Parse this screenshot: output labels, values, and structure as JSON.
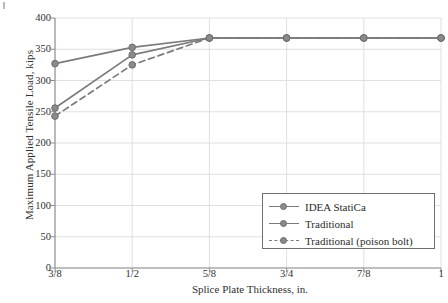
{
  "chart_data": {
    "type": "line",
    "title": "",
    "xlabel": "Splice Plate Thickness, in.",
    "ylabel": "Maximum Applied Tensile Load, kips",
    "categories": [
      "3/8",
      "1/2",
      "5/8",
      "3/4",
      "7/8",
      "1"
    ],
    "x_values": [
      0.375,
      0.5,
      0.625,
      0.75,
      0.875,
      1.0
    ],
    "xlim": [
      0.375,
      1.0
    ],
    "ylim": [
      0,
      400
    ],
    "yticks": [
      0,
      50,
      100,
      150,
      200,
      250,
      300,
      350,
      400
    ],
    "ytick_labels": [
      "0",
      "50",
      "100",
      "150",
      "200",
      "250",
      "300",
      "350",
      "400"
    ],
    "grid": true,
    "legend_position": "lower right",
    "series": [
      {
        "name": "IDEA StatiCa",
        "values": [
          327,
          353,
          368,
          368,
          368,
          368
        ],
        "style": "solid",
        "color": "#7b7b7b",
        "marker": "circle"
      },
      {
        "name": "Traditional",
        "values": [
          256,
          341,
          368,
          368,
          368,
          368
        ],
        "style": "solid",
        "color": "#7b7b7b",
        "marker": "circle"
      },
      {
        "name": "Traditional (poison bolt)",
        "values": [
          243,
          325,
          368,
          368,
          368,
          368
        ],
        "style": "dashed",
        "color": "#7b7b7b",
        "marker": "circle"
      }
    ]
  },
  "legend": {
    "items": [
      {
        "label": "IDEA StatiCa"
      },
      {
        "label": "Traditional"
      },
      {
        "label": "Traditional (poison bolt)"
      }
    ]
  },
  "colors": {
    "line": "#7b7b7b",
    "marker_fill": "#8a8a8a",
    "marker_edge": "#6d6d6d",
    "grid": "#d8d8d8",
    "axis": "#8e8e8e",
    "text": "#2f2f2f",
    "background": "#ffffff"
  }
}
